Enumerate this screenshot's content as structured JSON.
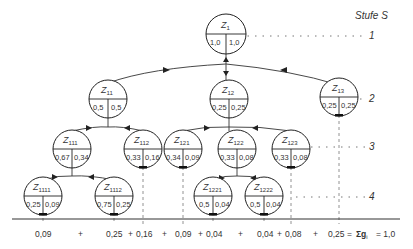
{
  "stage_label": "Stufe S",
  "stages": [
    "1",
    "2",
    "3",
    "4"
  ],
  "nodes": [
    {
      "id": "Z1",
      "name": "Z",
      "sub": "1",
      "left": "1,0",
      "right": "1,0"
    },
    {
      "id": "Z11",
      "name": "Z",
      "sub": "11",
      "left": "0,5",
      "right": "0,5"
    },
    {
      "id": "Z12",
      "name": "Z",
      "sub": "12",
      "left": "0,25",
      "right": "0,25"
    },
    {
      "id": "Z13",
      "name": "Z",
      "sub": "13",
      "left": "0,25",
      "right": "0,25"
    },
    {
      "id": "Z111",
      "name": "Z",
      "sub": "111",
      "left": "0,67",
      "right": "0,34"
    },
    {
      "id": "Z112",
      "name": "Z",
      "sub": "112",
      "left": "0,33",
      "right": "0,16"
    },
    {
      "id": "Z121",
      "name": "Z",
      "sub": "121",
      "left": "0,34",
      "right": "0,09"
    },
    {
      "id": "Z122",
      "name": "Z",
      "sub": "122",
      "left": "0,33",
      "right": "0,08"
    },
    {
      "id": "Z123",
      "name": "Z",
      "sub": "123",
      "left": "0,33",
      "right": "0,08"
    },
    {
      "id": "Z1111",
      "name": "Z",
      "sub": "1111",
      "left": "0,25",
      "right": "0,09"
    },
    {
      "id": "Z1112",
      "name": "Z",
      "sub": "1112",
      "left": "0,75",
      "right": "0,25"
    },
    {
      "id": "Z1221",
      "name": "Z",
      "sub": "1221",
      "left": "0,5",
      "right": "0,04"
    },
    {
      "id": "Z1222",
      "name": "Z",
      "sub": "1222",
      "left": "0,5",
      "right": "0,04"
    }
  ],
  "sum_row": {
    "terms": [
      "0,09",
      "+",
      "0,25",
      "+",
      "0,16",
      "+",
      "0,09",
      "+",
      "0,04",
      "+",
      "0,04",
      "+",
      "0,08",
      "+",
      "0,25"
    ],
    "equals": "=",
    "sigma": "Σg",
    "sigma_sub": "i",
    "total": "= 1,0"
  }
}
